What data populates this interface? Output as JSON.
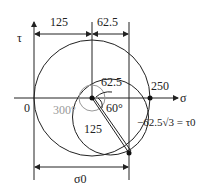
{
  "diagram": {
    "type": "mohr-circle",
    "axes": {
      "x_label": "σ",
      "y_label": "τ",
      "origin_label": "0"
    },
    "dimensions": {
      "top_left": "125",
      "top_right": "62.5",
      "bottom": "σ0"
    },
    "labels": {
      "small_radius": "62.5",
      "big_value": "250",
      "angle_small": "60°",
      "angle_large": "300°",
      "chord": "125",
      "tau_point": "−62.5√3 = τ0"
    }
  }
}
